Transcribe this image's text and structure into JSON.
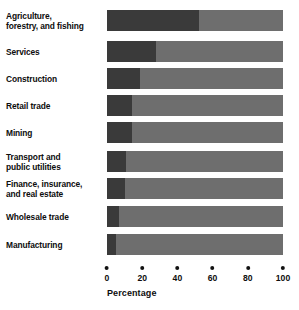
{
  "chart_data": {
    "type": "bar",
    "orientation": "horizontal",
    "stacked": true,
    "title": "",
    "xlabel": "Percentage",
    "ylabel": "",
    "xlim": [
      0,
      100
    ],
    "xticks": [
      0,
      20,
      40,
      60,
      80,
      100
    ],
    "xtick_labels": [
      "0",
      "20",
      "40",
      "60",
      "80",
      "100"
    ],
    "grid": false,
    "legend": "none",
    "categories": [
      "Agriculture, forestry, and fishing",
      "Services",
      "Construction",
      "Retail trade",
      "Mining",
      "Transport and public utilities",
      "Finance, insurance, and real estate",
      "Wholesale trade",
      "Manufacturing"
    ],
    "category_lines": [
      [
        "Agriculture,",
        "forestry, and fishing"
      ],
      [
        "Services"
      ],
      [
        "Construction"
      ],
      [
        "Retail trade"
      ],
      [
        "Mining"
      ],
      [
        "Transport and",
        "public utilities"
      ],
      [
        "Finance, insurance,",
        "and real estate"
      ],
      [
        "Wholesale trade"
      ],
      [
        "Manufacturing"
      ]
    ],
    "series": [
      {
        "name": "primary",
        "color": "#3a3a3a",
        "values": [
          52,
          28,
          19,
          14,
          14,
          11,
          10,
          7,
          5
        ]
      },
      {
        "name": "remainder",
        "color": "#6e6e6e",
        "values": [
          48,
          72,
          81,
          86,
          86,
          89,
          90,
          93,
          95
        ]
      }
    ]
  },
  "colors": {
    "background": "#ffffff",
    "primary_segment": "#3a3a3a",
    "remainder_segment": "#6e6e6e",
    "text": "#0d0d0d"
  }
}
